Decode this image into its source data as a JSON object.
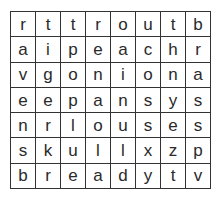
{
  "puzzle": {
    "type": "word-search",
    "rows": [
      [
        "r",
        "t",
        "t",
        "r",
        "o",
        "u",
        "t",
        "b"
      ],
      [
        "a",
        "i",
        "p",
        "e",
        "a",
        "c",
        "h",
        "r"
      ],
      [
        "v",
        "g",
        "o",
        "n",
        "i",
        "o",
        "n",
        "a"
      ],
      [
        "e",
        "e",
        "p",
        "a",
        "n",
        "s",
        "y",
        "s"
      ],
      [
        "n",
        "r",
        "l",
        "o",
        "u",
        "s",
        "e",
        "s"
      ],
      [
        "s",
        "k",
        "u",
        "l",
        "l",
        "x",
        "z",
        "p"
      ],
      [
        "b",
        "r",
        "e",
        "a",
        "d",
        "y",
        "t",
        "v"
      ]
    ]
  }
}
